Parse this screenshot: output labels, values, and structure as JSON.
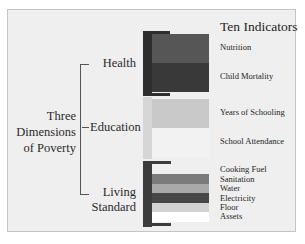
{
  "title": "Ten Indicators",
  "main_label": [
    "Three",
    "Dimensions",
    "of Poverty"
  ],
  "dimensions": [
    {
      "label": "Health",
      "label_lines": [
        "Health"
      ],
      "bracket_color": "#2e2e2e"
    },
    {
      "label": "Education",
      "label_lines": [
        "Education"
      ],
      "bracket_color": "#d6d6d6"
    },
    {
      "label": "Living Standard",
      "label_lines": [
        "Living",
        "Standard"
      ],
      "bracket_color": "#3c3c3c"
    }
  ],
  "indicators": [
    {
      "label": "Nutrition",
      "dimension": "Health",
      "color": "#565656"
    },
    {
      "label": "Child Mortality",
      "dimension": "Health",
      "color": "#393939"
    },
    {
      "label": "Years of Schooling",
      "dimension": "Education",
      "color": "#c9c9c9"
    },
    {
      "label": "School Attendance",
      "dimension": "Education",
      "color": "#f2f2f2"
    },
    {
      "label": "Cooking Fuel",
      "dimension": "Living Standard",
      "color": "#4a4a4a"
    },
    {
      "label": "Sanitation",
      "dimension": "Living Standard",
      "color": "#7b7b7b"
    },
    {
      "label": "Water",
      "dimension": "Living Standard",
      "color": "#a9a9a9"
    },
    {
      "label": "Electricity",
      "dimension": "Living Standard",
      "color": "#464646"
    },
    {
      "label": "Floor",
      "dimension": "Living Standard",
      "color": "#d2d2d2"
    },
    {
      "label": "Assets",
      "dimension": "Living Standard",
      "color": "#ffffff"
    }
  ]
}
